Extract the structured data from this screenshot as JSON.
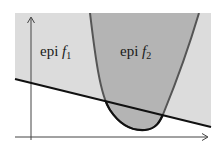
{
  "diagram": {
    "colors": {
      "background": "#ffffff",
      "epi_f1_fill": "#dcdcdc",
      "epi_f2_fill": "#b4b4b4",
      "parabola_stroke": "#555555",
      "parabola_stroke_below": "#111111",
      "line_stroke": "#111111",
      "axis_stroke": "#444444"
    },
    "labels": {
      "epi_f1": {
        "prefix": "epi ",
        "func": "f",
        "sub": "1"
      },
      "epi_f2": {
        "prefix": "epi ",
        "func": "f",
        "sub": "2"
      }
    },
    "regions": [
      {
        "name": "epi f1",
        "description": "light gray half-plane above the line"
      },
      {
        "name": "epi f2",
        "description": "darker gray region inside the parabola"
      }
    ],
    "axes": {
      "x_axis": {
        "arrow": "right"
      },
      "y_axis": {
        "arrow": "up"
      }
    }
  }
}
